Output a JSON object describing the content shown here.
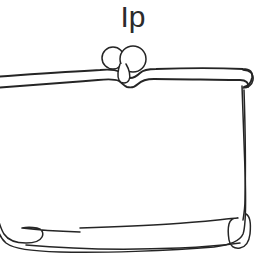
{
  "page": {
    "background_color": "#ffffff",
    "width": 266,
    "height": 272
  },
  "title": {
    "text": "Ip",
    "color": "#2b2b2b"
  },
  "drawing": {
    "name": "purse-line-drawing",
    "description": "Hand-drawn outline of a clutch purse with kiss-lock clasp",
    "stroke_color": "#252525",
    "fill_color": "#ffffff",
    "parts": {
      "clasp_left_knob": "clasp-knob-left",
      "clasp_right_knob": "clasp-knob-right",
      "clasp_pendant": "clasp-pendant",
      "frame_bar": "purse-frame-bar",
      "body": "purse-body",
      "foot_left": "purse-foot-left",
      "foot_right": "purse-foot-right"
    }
  }
}
